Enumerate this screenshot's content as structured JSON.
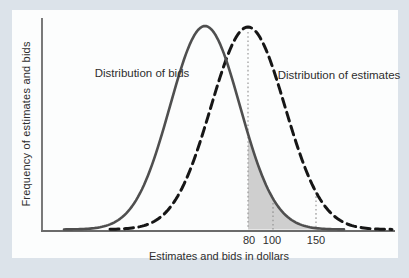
{
  "figure": {
    "background_color": "#dce3ea",
    "panel_color": "#fcfdfd"
  },
  "chart_data": {
    "type": "line",
    "title": "",
    "xlabel": "Estimates and bids in dollars",
    "ylabel": "Frequency of estimates and bids",
    "grid": false,
    "legend_position": "inline-annotations",
    "axis_color": "#6b6b6b",
    "baseline_px": 229.5,
    "axis": {
      "y_line": {
        "x": 42,
        "y1": 18,
        "y2": 231
      },
      "x_line": {
        "y": 231,
        "x1": 41,
        "x2": 395
      }
    },
    "xticks": [
      {
        "label": "80",
        "px": 248
      },
      {
        "label": "100",
        "px": 273
      },
      {
        "label": "150",
        "px": 316
      }
    ],
    "series": [
      {
        "name": "Distribution of bids",
        "shape": "gaussian",
        "style": "solid",
        "color": "#4f4f4f",
        "stroke_width": 2.6,
        "peak_px": 205,
        "peak_top_px": 26,
        "sigma_px": 35,
        "x_start_px": 64,
        "x_end_px": 344
      },
      {
        "name": "Distribution of estimates",
        "shape": "gaussian",
        "style": "dashed",
        "color": "#161616",
        "stroke_width": 3,
        "dash": "9 5.5",
        "peak_px": 248,
        "peak_top_px": 27,
        "sigma_px": 37,
        "x_start_px": 110,
        "x_end_px": 393
      }
    ],
    "shaded_region": {
      "description": "area under bids curve to the right of the $80 guide line",
      "series": 0,
      "from_px": 248,
      "to_px": 344,
      "fill": "#cfcfcf"
    },
    "guides": {
      "color": "#8f8f8f",
      "dash": "1.6 2.6",
      "items": [
        {
          "tick": 0,
          "top_series": 1,
          "top_offset": 5
        },
        {
          "tick": 1,
          "top_series": 0,
          "top_offset": 0
        },
        {
          "tick": 2,
          "top_series": 1,
          "top_offset": 0
        }
      ]
    }
  }
}
